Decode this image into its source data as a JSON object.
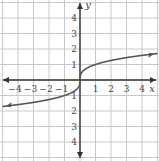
{
  "chart_data": {
    "type": "line",
    "title": "",
    "function": "y = cube root of x",
    "xlabel": "x",
    "ylabel": "y",
    "xlim": [
      -5,
      5
    ],
    "ylim": [
      -5,
      5
    ],
    "grid": true,
    "x_ticks": [
      "−4",
      "−3",
      "−2",
      "−1",
      "1",
      "2",
      "3",
      "4"
    ],
    "y_ticks": [
      "4",
      "3",
      "2",
      "1",
      "−1",
      "−2",
      "−3",
      "−4"
    ],
    "series": [
      {
        "name": "curve",
        "x": [
          -5,
          -4,
          -3,
          -2,
          -1,
          -0.5,
          -0.1,
          0,
          0.1,
          0.5,
          1,
          2,
          3,
          4,
          5
        ],
        "y": [
          -1.71,
          -1.59,
          -1.44,
          -1.26,
          -1,
          -0.79,
          -0.46,
          0,
          0.46,
          0.79,
          1,
          1.26,
          1.44,
          1.59,
          1.71
        ]
      }
    ],
    "colors": {
      "grid": "#c8c8c8",
      "axis": "#333333",
      "curve": "#555555"
    }
  }
}
